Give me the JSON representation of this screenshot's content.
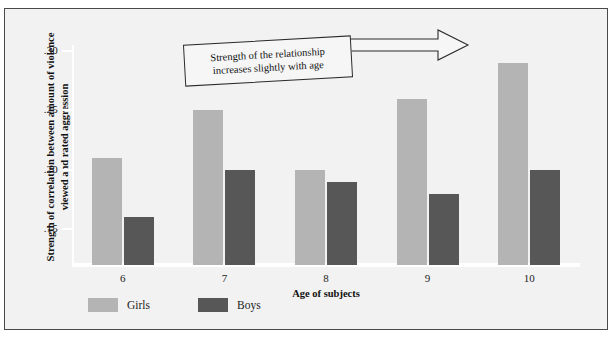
{
  "figure": {
    "background_color": "#f2f2f2",
    "frame_color": "#4a4a4a"
  },
  "annotation": {
    "name": "callout-box",
    "line1": "Strength of the relationship",
    "line2": "increases slightly with age",
    "text": "Strength of the relationship increases slightly with age",
    "arrow": "right-arrow"
  },
  "legend": {
    "position": "bottom-left",
    "entries": [
      {
        "label": "Girls",
        "color": "#b4b4b4"
      },
      {
        "label": "Boys",
        "color": "#575757"
      }
    ]
  },
  "axes": {
    "y_title_line1": "Strength of correlation between amount of violence",
    "y_title_line2": "viewed and rated aggression",
    "x_title": "Age of subjects",
    "y_ticks": [
      ".30",
      ".25",
      ".20",
      ".15"
    ],
    "x_ticks": [
      "6",
      "7",
      "8",
      "9",
      "10"
    ]
  },
  "chart_data": {
    "type": "bar",
    "title": "",
    "xlabel": "Age of subjects",
    "ylabel": "Strength of correlation between amount of violence viewed and rated aggression",
    "categories": [
      "6",
      "7",
      "8",
      "9",
      "10"
    ],
    "series": [
      {
        "name": "Girls",
        "color": "#b4b4b4",
        "values": [
          0.21,
          0.25,
          0.2,
          0.26,
          0.29
        ]
      },
      {
        "name": "Boys",
        "color": "#575757",
        "values": [
          0.16,
          0.2,
          0.19,
          0.18,
          0.2
        ]
      }
    ],
    "ylim": [
      0.12,
      0.305
    ],
    "ytick_values": [
      0.3,
      0.25,
      0.2,
      0.15
    ],
    "ytick_labels": [
      ".30",
      ".25",
      ".20",
      ".15"
    ],
    "grid": false,
    "legend_position": "bottom-left",
    "annotations": [
      {
        "text": "Strength of the relationship increases slightly with age",
        "shape": "box-with-right-arrow"
      }
    ]
  }
}
